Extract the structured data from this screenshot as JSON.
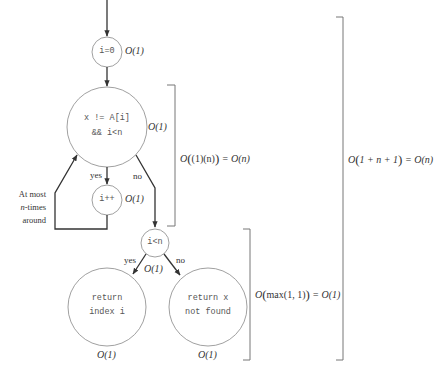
{
  "diagram": {
    "type": "flowchart",
    "nodes": {
      "init": {
        "code": "i=0",
        "cost": "O(1)"
      },
      "loop_check": {
        "code_line1": "x != A[i]",
        "code_line2": "&& i<n",
        "cost": "O(1)"
      },
      "increment": {
        "code": "i++",
        "cost": "O(1)"
      },
      "final_check": {
        "code": "i<n",
        "cost": "O(1)"
      },
      "return_index": {
        "code_line1": "return",
        "code_line2": "index i",
        "cost": "O(1)"
      },
      "return_not_found": {
        "code_line1": "return x",
        "code_line2": "not found",
        "cost": "O(1)"
      }
    },
    "edges": {
      "loop_yes": "yes",
      "loop_no": "no",
      "final_yes": "yes",
      "final_no": "no"
    },
    "loop_note": {
      "line1": "At most",
      "line2_var": "n",
      "line2_rest": "-times",
      "line3": "around"
    },
    "brackets": {
      "loop_total": {
        "prefix": "O",
        "inner": "(1)(n)",
        "result": "O(n)"
      },
      "branch_total": {
        "prefix": "O",
        "inner": "max(1, 1)",
        "result": "O(1)"
      },
      "overall_total": {
        "prefix": "O",
        "inner": "1 + n + 1",
        "result": "O(n)"
      }
    },
    "colors": {
      "stroke": "#333333",
      "circle": "#888888",
      "bracket": "#777777",
      "text": "#333333"
    }
  }
}
